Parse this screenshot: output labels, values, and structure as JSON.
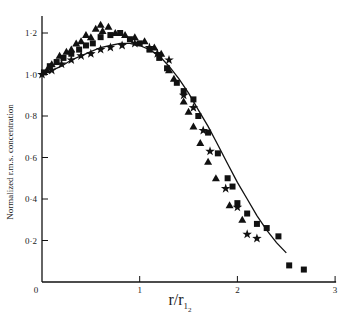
{
  "chart_data": {
    "type": "scatter",
    "title": "",
    "xlabel": "r/r_1/2",
    "xlabel_main": "r/r",
    "xlabel_sub": "1",
    "xlabel_sub2": "2",
    "ylabel": "Normalized r.m.s. concentration",
    "xlim": [
      0,
      3
    ],
    "ylim": [
      0,
      1.3
    ],
    "grid": false,
    "legend": null,
    "x_ticks": [
      0,
      1,
      2,
      3
    ],
    "x_tick_labels": [
      "0",
      "1",
      "2",
      "3"
    ],
    "y_ticks": [
      0.2,
      0.4,
      0.6,
      0.8,
      1.0,
      1.2
    ],
    "y_tick_labels": [
      "0·2",
      "0·4",
      "0·6",
      "0·8",
      "1·0",
      "1·2"
    ],
    "origin_label": "0",
    "series": [
      {
        "name": "curve",
        "type": "line",
        "x": [
          0,
          0.1,
          0.2,
          0.3,
          0.4,
          0.5,
          0.6,
          0.7,
          0.8,
          0.9,
          1.0,
          1.1,
          1.2,
          1.3,
          1.4,
          1.5,
          1.6,
          1.7,
          1.8,
          1.9,
          2.0,
          2.1,
          2.2,
          2.3,
          2.4,
          2.5
        ],
        "y": [
          1.0,
          1.02,
          1.04,
          1.07,
          1.09,
          1.11,
          1.13,
          1.14,
          1.15,
          1.15,
          1.14,
          1.12,
          1.09,
          1.04,
          0.98,
          0.91,
          0.83,
          0.75,
          0.66,
          0.57,
          0.48,
          0.4,
          0.32,
          0.25,
          0.19,
          0.14
        ]
      },
      {
        "name": "triangles",
        "marker": "triangle",
        "x": [
          0.05,
          0.1,
          0.18,
          0.25,
          0.3,
          0.35,
          0.4,
          0.45,
          0.5,
          0.55,
          0.6,
          0.62,
          0.68,
          0.75,
          0.85,
          0.95,
          1.05,
          1.15,
          1.22,
          1.3,
          1.35,
          1.45,
          1.5,
          1.55,
          1.62,
          1.7,
          1.78,
          1.92,
          2.05
        ],
        "y": [
          1.02,
          1.05,
          1.09,
          1.11,
          1.12,
          1.15,
          1.16,
          1.19,
          1.18,
          1.22,
          1.24,
          1.21,
          1.23,
          1.2,
          1.19,
          1.18,
          1.16,
          1.13,
          1.1,
          1.02,
          0.98,
          0.87,
          0.82,
          0.75,
          0.67,
          0.58,
          0.5,
          0.37,
          0.3
        ]
      },
      {
        "name": "squares",
        "marker": "square",
        "x": [
          0.02,
          0.08,
          0.15,
          0.22,
          0.3,
          0.38,
          0.45,
          0.52,
          0.6,
          0.7,
          0.8,
          0.9,
          1.0,
          1.1,
          1.2,
          1.28,
          1.38,
          1.45,
          1.55,
          1.6,
          1.7,
          1.8,
          1.9,
          1.95,
          2.0,
          2.1,
          2.2,
          2.3,
          2.42,
          2.53,
          2.68
        ],
        "y": [
          1.01,
          1.04,
          1.06,
          1.08,
          1.1,
          1.12,
          1.14,
          1.15,
          1.18,
          1.19,
          1.2,
          1.17,
          1.15,
          1.12,
          1.08,
          1.03,
          0.96,
          0.92,
          0.88,
          0.8,
          0.72,
          0.62,
          0.5,
          0.46,
          0.38,
          0.33,
          0.28,
          0.26,
          0.22,
          0.08,
          0.06
        ]
      },
      {
        "name": "stars",
        "marker": "star",
        "x": [
          0.0,
          0.1,
          0.2,
          0.3,
          0.4,
          0.5,
          0.6,
          0.7,
          0.82,
          0.95,
          1.1,
          1.18,
          1.3,
          1.45,
          1.55,
          1.65,
          1.72,
          1.88,
          2.0,
          2.1,
          2.2
        ],
        "y": [
          1.0,
          1.02,
          1.05,
          1.07,
          1.09,
          1.1,
          1.12,
          1.13,
          1.14,
          1.15,
          1.13,
          1.1,
          1.07,
          0.9,
          0.84,
          0.73,
          0.63,
          0.45,
          0.36,
          0.23,
          0.21
        ]
      }
    ]
  }
}
